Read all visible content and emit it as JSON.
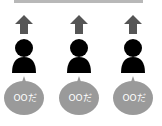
{
  "diagram": {
    "top_bar_color": "#b8b8b8",
    "arrow_color": "#555555",
    "person_color": "#000000",
    "bubble_color": "#9a9a9a",
    "columns": [
      {
        "icon": "person-icon",
        "arrow": "arrow-up-icon",
        "bubble_text": "OOだ"
      },
      {
        "icon": "person-icon",
        "arrow": "arrow-up-icon",
        "bubble_text": "OOだ"
      },
      {
        "icon": "person-icon",
        "arrow": "arrow-up-icon",
        "bubble_text": "OOだ"
      }
    ]
  }
}
